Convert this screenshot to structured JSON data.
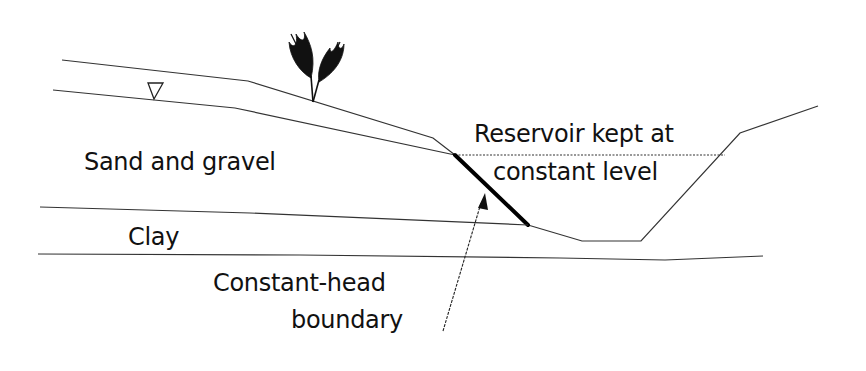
{
  "diagram": {
    "labels": {
      "sand_gravel": "Sand and gravel",
      "clay": "Clay",
      "reservoir_line1": "Reservoir kept at",
      "reservoir_line2": "constant level",
      "boundary_line1": "Constant-head",
      "boundary_line2": "boundary"
    },
    "symbols": {
      "water_table": "water-table-triangle",
      "vegetation": "plant"
    },
    "colors": {
      "line": "#333333",
      "text": "#111111",
      "boundary": "#000000",
      "background": "#ffffff"
    }
  }
}
